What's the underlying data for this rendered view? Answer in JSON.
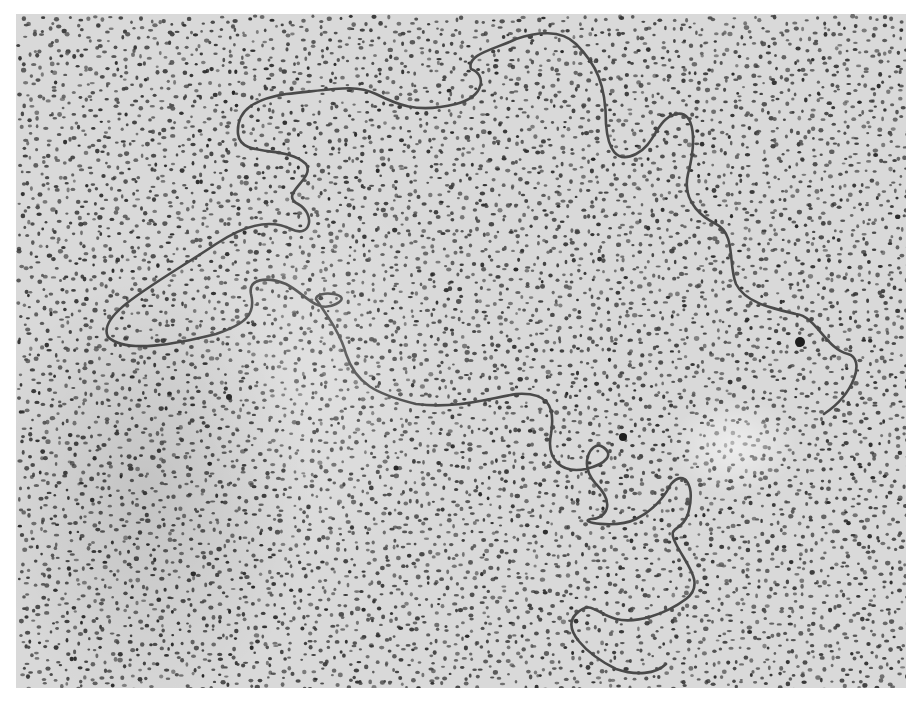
{
  "image": {
    "subject": "electron micrograph of a single long molecular strand on a stippled (granular) background",
    "colors": {
      "page_background": "#ffffff",
      "field_background": "#d9d9d9",
      "stipple": "#3a3a3a",
      "strand": "#4a4a4a"
    },
    "frame": {
      "left": 16,
      "top": 14,
      "width": 890,
      "height": 674
    },
    "strand_path": "M 92 323 C 80 300, 140 270, 200 230 C 230 210, 255 205, 275 215 C 295 225, 300 200, 282 190 C 262 180, 300 165, 290 150 C 270 130, 225 145, 222 120 C 220 95, 240 85, 270 80 C 320 75, 340 70, 360 80 C 380 90, 400 100, 440 90 C 470 82, 470 60, 455 55 C 450 40, 480 35, 500 25 C 520 18, 545 15, 560 30 C 580 50, 590 70, 590 110 C 592 135, 600 150, 620 140 C 640 130, 640 105, 660 100 C 680 96, 680 130, 672 160 C 665 190, 690 205, 700 210 C 720 220, 712 250, 720 270 C 730 290, 760 295, 780 300 C 800 302, 810 335, 832 340 C 850 345, 838 380, 808 400",
    "strand_path_2": "M 92 323 C 110 340, 160 330, 200 320 C 230 310, 240 300, 235 280 C 232 265, 250 262, 270 270 C 290 280, 300 300, 320 290 C 340 280, 300 275, 300 285 C 310 300, 325 320, 330 340 C 340 370, 360 380, 400 390 C 440 395, 470 385, 500 380 C 530 378, 540 390, 535 420 C 530 445, 545 460, 570 455 C 590 450, 600 440, 585 432 C 575 428, 562 450, 580 470 C 600 490, 590 505, 575 505 C 560 508, 600 515, 620 505 C 640 495, 650 480, 655 470 C 668 455, 680 470, 672 500 C 665 520, 650 510, 660 530 C 670 550, 690 570, 670 585 C 650 600, 620 610, 600 605 C 580 600, 575 585, 560 600 C 545 615, 570 640, 600 655 C 620 662, 640 660, 650 650",
    "landmarks": [
      {
        "name": "dark-particle-1",
        "x": 623,
        "y": 437,
        "r": 4
      },
      {
        "name": "dark-particle-2",
        "x": 229,
        "y": 397,
        "r": 3
      },
      {
        "name": "dark-particle-3",
        "x": 396,
        "y": 468,
        "r": 2.5
      },
      {
        "name": "strand-end-knot",
        "x": 800,
        "y": 342,
        "r": 5
      }
    ]
  }
}
